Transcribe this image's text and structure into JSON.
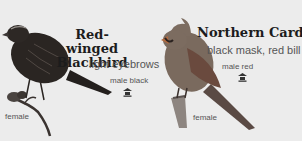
{
  "birds": [
    {
      "name_line1": "Red-winged",
      "name_line2": "Blackbird",
      "feature": "light eyebrows",
      "male_note": "male black",
      "female_label": "female",
      "icon": "bird-feeder-icon"
    },
    {
      "name": "Northern Cardinal",
      "feature": "black mask, red bill",
      "male_note": "male red",
      "female_label": "female",
      "icon": "bird-feeder-icon"
    }
  ],
  "colors": {
    "background": "#ececec",
    "blackbird": "#2a2522",
    "cardinal_body": "#7a6a5e",
    "cardinal_wing": "#8a5a48",
    "title": "#1c1c1c"
  }
}
